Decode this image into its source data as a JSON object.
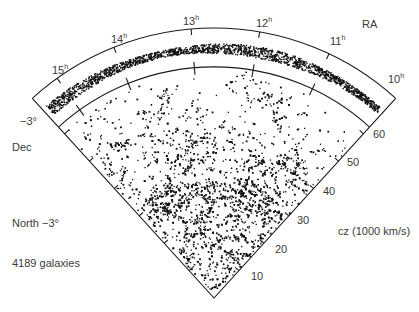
{
  "chart_data": {
    "type": "scatter",
    "subtype": "redshift-survey-wedge (polar cone diagram)",
    "title": "",
    "annotations": {
      "ra_axis_label": "RA",
      "dec_axis_label": "Dec",
      "dec_value": "−3°",
      "slice_label": "North −3°",
      "count_label": "4189 galaxies",
      "cz_axis_label": "cz (1000 km/s)"
    },
    "ra_ticks": [
      {
        "label": "15",
        "sup": "h",
        "x": 52,
        "y": 63
      },
      {
        "label": "14",
        "sup": "h",
        "x": 111,
        "y": 32
      },
      {
        "label": "13",
        "sup": "h",
        "x": 183,
        "y": 14
      },
      {
        "label": "12",
        "sup": "h",
        "x": 256,
        "y": 16
      },
      {
        "label": "11",
        "sup": "h",
        "x": 330,
        "y": 34
      },
      {
        "label": "10",
        "sup": "h",
        "x": 388,
        "y": 72
      }
    ],
    "cz_ticks": [
      {
        "label": "10",
        "x": 251,
        "y": 271
      },
      {
        "label": "20",
        "x": 275,
        "y": 244
      },
      {
        "label": "30",
        "x": 297,
        "y": 215
      },
      {
        "label": "40",
        "x": 323,
        "y": 186
      },
      {
        "label": "50",
        "x": 347,
        "y": 157
      },
      {
        "label": "60",
        "x": 373,
        "y": 129
      }
    ],
    "cz_range": [
      0,
      62
    ],
    "ra_range_hours": [
      10,
      15.5
    ],
    "grid": false,
    "legend": "none",
    "galaxy_count": 4189,
    "colors": {
      "ink": "#111111",
      "label": "#3a3a3a",
      "background": "#ffffff"
    }
  }
}
